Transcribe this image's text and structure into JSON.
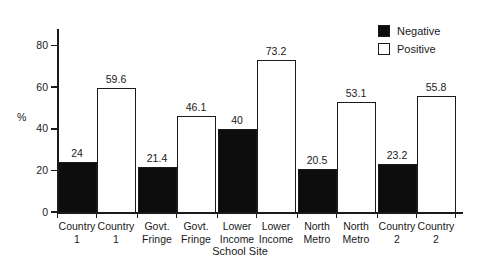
{
  "chart_data": {
    "type": "bar",
    "title": "",
    "xlabel": "School Site",
    "ylabel": "%",
    "ylim": [
      0,
      88
    ],
    "yticks": [
      0,
      20,
      40,
      60,
      80
    ],
    "ytick_labels": [
      "0",
      "20",
      "40",
      "60",
      "80"
    ],
    "grid": false,
    "legend_position": "top-right",
    "categories": [
      "Country 1",
      "Govt. Fringe",
      "Lower Income",
      "North Metro",
      "Country 2"
    ],
    "series": [
      {
        "name": "Negative",
        "color": "#0d0d0d",
        "values": [
          24,
          21.4,
          40,
          20.5,
          23.2
        ]
      },
      {
        "name": "Positive",
        "color": "#ffffff",
        "values": [
          59.6,
          46.1,
          73.2,
          53.1,
          55.8
        ]
      }
    ],
    "bars": [
      {
        "group": "Country 1",
        "series": "Negative",
        "value": 24,
        "label": "24",
        "label_line1": "Country",
        "label_line2": "1"
      },
      {
        "group": "Country 1",
        "series": "Positive",
        "value": 59.6,
        "label": "59.6",
        "label_line1": "Country",
        "label_line2": "1"
      },
      {
        "group": "Govt. Fringe",
        "series": "Negative",
        "value": 21.4,
        "label": "21.4",
        "label_line1": "Govt.",
        "label_line2": "Fringe"
      },
      {
        "group": "Govt. Fringe",
        "series": "Positive",
        "value": 46.1,
        "label": "46.1",
        "label_line1": "Govt.",
        "label_line2": "Fringe"
      },
      {
        "group": "Lower Income",
        "series": "Negative",
        "value": 40,
        "label": "40",
        "label_line1": "Lower",
        "label_line2": "Income"
      },
      {
        "group": "Lower Income",
        "series": "Positive",
        "value": 73.2,
        "label": "73.2",
        "label_line1": "Lower",
        "label_line2": "Income"
      },
      {
        "group": "North Metro",
        "series": "Negative",
        "value": 20.5,
        "label": "20.5",
        "label_line1": "North",
        "label_line2": "Metro"
      },
      {
        "group": "North Metro",
        "series": "Positive",
        "value": 53.1,
        "label": "53.1",
        "label_line1": "North",
        "label_line2": "Metro"
      },
      {
        "group": "Country 2",
        "series": "Negative",
        "value": 23.2,
        "label": "23.2",
        "label_line1": "Country",
        "label_line2": "2"
      },
      {
        "group": "Country 2",
        "series": "Positive",
        "value": 55.8,
        "label": "55.8",
        "label_line1": "Country",
        "label_line2": "2"
      }
    ]
  },
  "legend": {
    "entries": [
      {
        "label": "Negative",
        "swatch": "negative"
      },
      {
        "label": "Positive",
        "swatch": "positive"
      }
    ]
  },
  "axes": {
    "y_title": "%",
    "x_title": "School Site"
  }
}
